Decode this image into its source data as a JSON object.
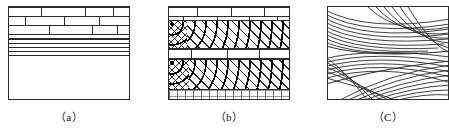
{
  "figure": {
    "panels": [
      {
        "id": "a",
        "caption": "（a）",
        "label_text": "(a)",
        "units": [
          {
            "name": "brick-unit",
            "pattern": "brick",
            "top_pct": 0,
            "height_pct": 33
          },
          {
            "name": "laminated-unit",
            "pattern": "laminated",
            "top_pct": 33,
            "height_pct": 18
          },
          {
            "name": "stipple-unit",
            "pattern": "dot-grid",
            "top_pct": 51,
            "height_pct": 49
          }
        ]
      },
      {
        "id": "b",
        "caption": "（b）",
        "label_text": "(b)",
        "units": [
          {
            "name": "brick-unit-upper",
            "pattern": "brick",
            "top_pct": 0,
            "height_pct": 14
          },
          {
            "name": "hatch-dots-upper",
            "pattern": "hatch-dots",
            "top_pct": 14,
            "height_pct": 30
          },
          {
            "name": "brick-unit-middle",
            "pattern": "brick",
            "top_pct": 44,
            "height_pct": 12
          },
          {
            "name": "hatch-dots-lower",
            "pattern": "hatch-dots",
            "top_pct": 56,
            "height_pct": 33
          },
          {
            "name": "marl-unit-basal",
            "pattern": "marl",
            "top_pct": 89,
            "height_pct": 11
          }
        ]
      },
      {
        "id": "c",
        "caption": "（C）",
        "label_text": "(C)",
        "units": [
          {
            "name": "cross-bedding-unit",
            "pattern": "cross-bedded-arcs",
            "top_pct": 0,
            "height_pct": 100
          }
        ]
      }
    ]
  },
  "style": {
    "line_color": "#2b2b2b",
    "dot_color": "#000000",
    "background": "#ffffff"
  }
}
